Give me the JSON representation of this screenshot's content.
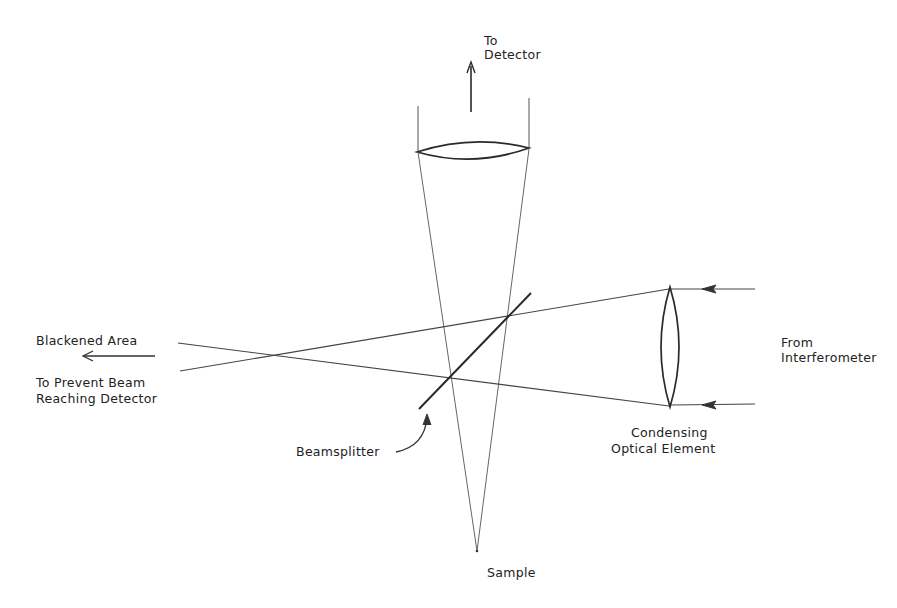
{
  "diagram": {
    "colors": {
      "line": "#4a4a4a",
      "thick": "#2a2a2a",
      "text": "#222222"
    },
    "labels": {
      "to_detector_1": "To",
      "to_detector_2": "Detector",
      "blackened_1": "Blackened Area",
      "blackened_2": "To Prevent Beam",
      "blackened_3": "Reaching Detector",
      "from_interferometer_1": "From",
      "from_interferometer_2": "Interferometer",
      "condensing_1": "Condensing",
      "condensing_2": "Optical Element",
      "beamsplitter": "Beamsplitter",
      "sample": "Sample"
    },
    "components": [
      {
        "name": "collection-lens",
        "center": [
          473,
          151
        ],
        "width": 112
      },
      {
        "name": "condensing-lens",
        "center": [
          670,
          347
        ],
        "height": 118
      },
      {
        "name": "beamsplitter",
        "from": [
          420,
          408
        ],
        "to": [
          530,
          293
        ]
      },
      {
        "name": "sample-point",
        "at": [
          477,
          551
        ]
      },
      {
        "name": "beam-crossing",
        "at": [
          280,
          355
        ]
      }
    ]
  }
}
